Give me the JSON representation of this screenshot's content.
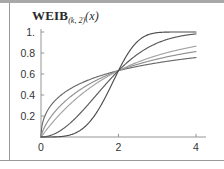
{
  "figure": {
    "title": {
      "base": "WEIB",
      "subscript": "(k, 2)",
      "argument": "(x)",
      "full": "WEIB(k, 2)(x)"
    }
  },
  "chart_data": {
    "type": "line",
    "title": "WEIB(k, 2)(x)",
    "xlabel": "",
    "ylabel": "",
    "xlim": [
      0,
      4.3
    ],
    "ylim": [
      0,
      1.05
    ],
    "grid": false,
    "legend": null,
    "x_ticks": [
      "0",
      "2",
      "4"
    ],
    "x_tick_values": [
      0,
      2,
      4
    ],
    "y_ticks": [
      "0.2",
      "0.4",
      "0.6",
      "0.8",
      "1."
    ],
    "y_tick_values": [
      0.2,
      0.4,
      0.6,
      0.8,
      1.0
    ],
    "crossing_point": [
      2,
      0.632
    ],
    "series": [
      {
        "name": "k = 0.5",
        "color": "#6b6b6b",
        "k": 0.5,
        "lambda": 2,
        "x": [
          0,
          0.1,
          0.2,
          0.3,
          0.5,
          0.75,
          1.0,
          1.5,
          2.0,
          2.5,
          3.0,
          3.5,
          4.0
        ],
        "values": [
          0.0,
          0.2007,
          0.2699,
          0.3197,
          0.3935,
          0.4581,
          0.5069,
          0.5799,
          0.6321,
          0.6723,
          0.7045,
          0.731,
          0.7534
        ]
      },
      {
        "name": "k = 0.75",
        "color": "#8f8f8f",
        "k": 0.75,
        "lambda": 2,
        "x": [
          0,
          0.1,
          0.2,
          0.3,
          0.5,
          0.75,
          1.0,
          1.5,
          2.0,
          2.5,
          3.0,
          3.5,
          4.0
        ],
        "values": [
          0.0,
          0.101,
          0.1597,
          0.2084,
          0.2884,
          0.367,
          0.4308,
          0.5317,
          0.6321,
          0.6751,
          0.7226,
          0.7629,
          0.7974
        ]
      },
      {
        "name": "k = 1",
        "color": "#a3a3a3",
        "k": 1.0,
        "lambda": 2,
        "x": [
          0,
          0.1,
          0.2,
          0.3,
          0.5,
          0.75,
          1.0,
          1.5,
          2.0,
          2.5,
          3.0,
          3.5,
          4.0
        ],
        "values": [
          0.0,
          0.0488,
          0.0952,
          0.1393,
          0.2212,
          0.3127,
          0.3935,
          0.5276,
          0.6321,
          0.7135,
          0.7769,
          0.8262,
          0.8647
        ]
      },
      {
        "name": "k = 2",
        "color": "#5a5a5a",
        "k": 2.0,
        "lambda": 2,
        "x": [
          0,
          0.1,
          0.2,
          0.3,
          0.5,
          0.75,
          1.0,
          1.5,
          2.0,
          2.5,
          3.0,
          3.5,
          4.0
        ],
        "values": [
          0.0,
          0.0025,
          0.01,
          0.0223,
          0.0615,
          0.1331,
          0.2212,
          0.4261,
          0.6321,
          0.7918,
          0.8946,
          0.9529,
          0.9817
        ]
      },
      {
        "name": "k = 4",
        "color": "#4d4d4d",
        "k": 4.0,
        "lambda": 2,
        "x": [
          0,
          0.1,
          0.2,
          0.3,
          0.5,
          0.75,
          1.0,
          1.5,
          2.0,
          2.5,
          3.0,
          3.5,
          4.0
        ],
        "values": [
          0.0,
          0.0,
          0.0001,
          0.0005,
          0.0039,
          0.0194,
          0.0606,
          0.2718,
          0.6321,
          0.9094,
          0.9936,
          0.9999,
          1.0
        ]
      }
    ]
  }
}
